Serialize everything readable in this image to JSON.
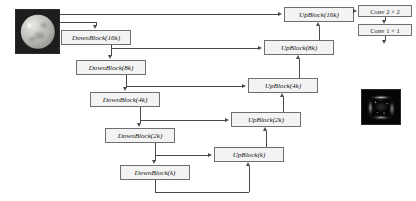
{
  "diagram": {
    "colors": {
      "box_fill": "#f3f3f3",
      "box_border": "#6f6f6f",
      "line": "#4a4a4a",
      "text": "#141414"
    },
    "encoder": [
      {
        "label": "DownBlock(16k)",
        "level": "16k"
      },
      {
        "label": "DownBlock(8k)",
        "level": "8k"
      },
      {
        "label": "DownBlock(4k)",
        "level": "4k"
      },
      {
        "label": "DownBlock(2k)",
        "level": "2k"
      },
      {
        "label": "DownBlock(k)",
        "level": "k"
      }
    ],
    "decoder": [
      {
        "label": "UpBlock(16k)",
        "level": "16k"
      },
      {
        "label": "UpBlock(8k)",
        "level": "8k"
      },
      {
        "label": "UpBlock(4k)",
        "level": "4k"
      },
      {
        "label": "UpBlock(2k)",
        "level": "2k"
      },
      {
        "label": "UpBlock(k)",
        "level": "k"
      }
    ],
    "heads": [
      {
        "label": "Conv 2 × 2"
      },
      {
        "label": "Conv 1 × 1"
      }
    ],
    "images": [
      {
        "name": "input-image",
        "description": "grayscale sphere on dark background"
      },
      {
        "name": "output-image",
        "description": "dark field with bright filament structures"
      }
    ]
  }
}
